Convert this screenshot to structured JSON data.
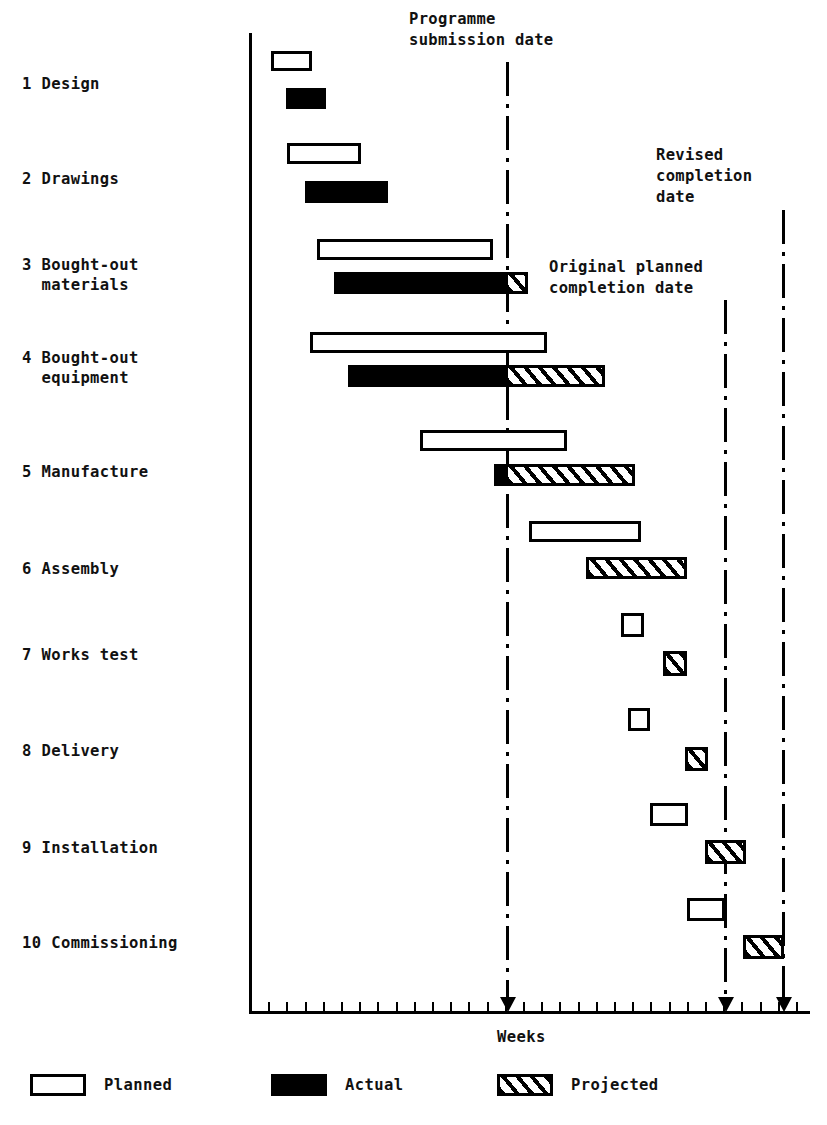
{
  "chart_data": {
    "type": "bar",
    "chart_kind": "gantt",
    "title": "",
    "xlabel": "Weeks",
    "ylabel": "",
    "grid": false,
    "axis": {
      "y_axis_x": 249,
      "x_axis_y": 1013,
      "x_axis_left": 249,
      "x_axis_right": 810,
      "tick_start_x": 250,
      "tick_spacing": 18.2,
      "tick_count": 31,
      "tick_height": 11
    },
    "categories": [
      "1 Design",
      "2 Drawings",
      "3 Bought-out materials",
      "4 Bought-out equipment",
      "5 Manufacture",
      "6 Assembly",
      "7 Works test",
      "8 Delivery",
      "9 Installation",
      "10 Commissioning"
    ],
    "series": [
      {
        "name": "Planned",
        "style": "outline"
      },
      {
        "name": "Actual",
        "style": "solid-black"
      },
      {
        "name": "Projected",
        "style": "hatched"
      }
    ],
    "tasks": [
      {
        "id": 1,
        "label_line1": "1 Design",
        "label_line2": "",
        "label_x": 22,
        "label_y": 74,
        "planned": {
          "x": 271,
          "y": 51,
          "w": 41,
          "h": 20
        },
        "actual": {
          "x": 286,
          "y": 88,
          "w": 40,
          "h": 21
        },
        "projected": null
      },
      {
        "id": 2,
        "label_line1": "2 Drawings",
        "label_line2": "",
        "label_x": 22,
        "label_y": 169,
        "planned": {
          "x": 287,
          "y": 143,
          "w": 74,
          "h": 21
        },
        "actual": {
          "x": 305,
          "y": 181,
          "w": 83,
          "h": 22
        },
        "projected": null
      },
      {
        "id": 3,
        "label_line1": "3 Bought-out",
        "label_line2": "  materials",
        "label_x": 22,
        "label_y": 255,
        "planned": {
          "x": 317,
          "y": 239,
          "w": 176,
          "h": 21
        },
        "actual": {
          "x": 334,
          "y": 272,
          "w": 172,
          "h": 22
        },
        "projected": {
          "x": 505,
          "y": 272,
          "w": 23,
          "h": 22
        }
      },
      {
        "id": 4,
        "label_line1": "4 Bought-out",
        "label_line2": "  equipment",
        "label_x": 22,
        "label_y": 348,
        "planned": {
          "x": 310,
          "y": 332,
          "w": 237,
          "h": 21
        },
        "actual": {
          "x": 348,
          "y": 365,
          "w": 158,
          "h": 22
        },
        "projected": {
          "x": 505,
          "y": 365,
          "w": 100,
          "h": 22
        }
      },
      {
        "id": 5,
        "label_line1": "5 Manufacture",
        "label_line2": "",
        "label_x": 22,
        "label_y": 462,
        "planned": {
          "x": 420,
          "y": 430,
          "w": 147,
          "h": 21
        },
        "actual": {
          "x": 494,
          "y": 464,
          "w": 13,
          "h": 22
        },
        "projected": {
          "x": 505,
          "y": 464,
          "w": 130,
          "h": 22
        }
      },
      {
        "id": 6,
        "label_line1": "6 Assembly",
        "label_line2": "",
        "label_x": 22,
        "label_y": 559,
        "planned": {
          "x": 529,
          "y": 521,
          "w": 112,
          "h": 21
        },
        "actual": null,
        "projected": {
          "x": 586,
          "y": 557,
          "w": 101,
          "h": 22
        }
      },
      {
        "id": 7,
        "label_line1": "7 Works test",
        "label_line2": "",
        "label_x": 22,
        "label_y": 645,
        "planned": {
          "x": 621,
          "y": 613,
          "w": 23,
          "h": 24
        },
        "actual": null,
        "projected": {
          "x": 663,
          "y": 651,
          "w": 24,
          "h": 25
        }
      },
      {
        "id": 8,
        "label_line1": "8 Delivery",
        "label_line2": "",
        "label_x": 22,
        "label_y": 741,
        "planned": {
          "x": 628,
          "y": 708,
          "w": 22,
          "h": 23
        },
        "actual": null,
        "projected": {
          "x": 685,
          "y": 747,
          "w": 23,
          "h": 24
        }
      },
      {
        "id": 9,
        "label_line1": "9 Installation",
        "label_line2": "",
        "label_x": 22,
        "label_y": 838,
        "planned": {
          "x": 650,
          "y": 803,
          "w": 38,
          "h": 23
        },
        "actual": null,
        "projected": {
          "x": 705,
          "y": 840,
          "w": 41,
          "h": 24
        }
      },
      {
        "id": 10,
        "label_line1": "10 Commissioning",
        "label_line2": "",
        "label_x": 22,
        "label_y": 933,
        "planned": {
          "x": 687,
          "y": 898,
          "w": 38,
          "h": 23
        },
        "actual": null,
        "projected": {
          "x": 743,
          "y": 935,
          "w": 41,
          "h": 24
        }
      }
    ],
    "reference_lines": [
      {
        "name": "programme-submission-date",
        "label": "Programme\nsubmission date",
        "label_line1": "Programme",
        "label_line2": "submission date",
        "label_x": 409,
        "label_y": 9,
        "x": 506,
        "y_top": 62,
        "y_bottom": 1013,
        "style": "dash-dot",
        "arrow": true
      },
      {
        "name": "original-planned-completion-date",
        "label": "Original planned\ncompletion date",
        "label_line1": "Original planned",
        "label_line2": "completion date",
        "label_x": 549,
        "label_y": 257,
        "x": 724,
        "y_top": 300,
        "y_bottom": 1013,
        "style": "dash-dot",
        "arrow": true
      },
      {
        "name": "revised-completion-date",
        "label": "Revised\ncompletion\ndate",
        "label_line1": "Revised",
        "label_line2": "completion",
        "label_line3": "date",
        "label_x": 656,
        "label_y": 145,
        "x": 782,
        "y_top": 210,
        "y_bottom": 1013,
        "style": "dash-dot",
        "arrow": true
      }
    ],
    "legend": {
      "position": "bottom",
      "items": [
        {
          "label": "Planned",
          "swatch": "outline",
          "x": 30,
          "y": 1074
        },
        {
          "label": "Actual",
          "swatch": "solid-black",
          "x": 271,
          "y": 1074
        },
        {
          "label": "Projected",
          "swatch": "hatched",
          "x": 497,
          "y": 1074
        }
      ]
    },
    "axis_caption": {
      "text": "Weeks",
      "x": 497,
      "y": 1028
    }
  },
  "colors": {
    "ink": "#000000",
    "background": "#ffffff"
  }
}
